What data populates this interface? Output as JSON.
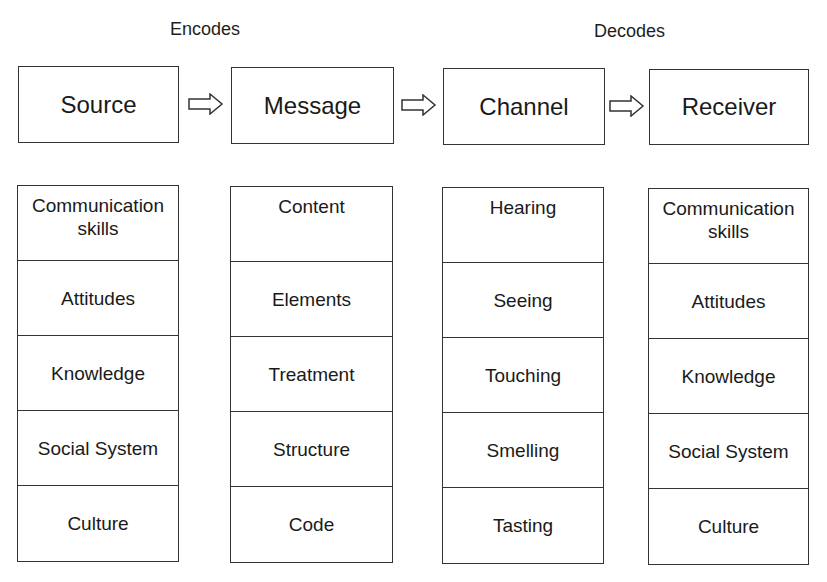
{
  "labels": {
    "encodes": "Encodes",
    "decodes": "Decodes"
  },
  "stages": [
    {
      "title": "Source",
      "items": [
        "Communication skills",
        "Attitudes",
        "Knowledge",
        "Social System",
        "Culture"
      ]
    },
    {
      "title": "Message",
      "items": [
        "Content",
        "Elements",
        "Treatment",
        "Structure",
        "Code"
      ]
    },
    {
      "title": "Channel",
      "items": [
        "Hearing",
        "Seeing",
        "Touching",
        "Smelling",
        "Tasting"
      ]
    },
    {
      "title": "Receiver",
      "items": [
        "Communication skills",
        "Attitudes",
        "Knowledge",
        "Social System",
        "Culture"
      ]
    }
  ],
  "arrows": [
    "right-arrow",
    "right-arrow",
    "right-arrow"
  ]
}
